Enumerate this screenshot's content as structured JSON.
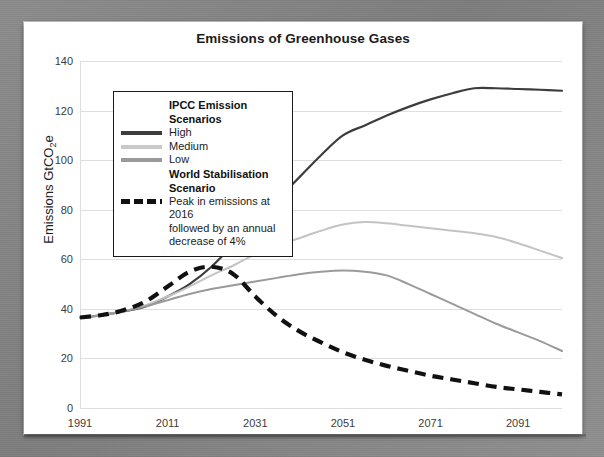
{
  "chart_data": {
    "type": "line",
    "title": "Emissions of Greenhouse Gases",
    "xlabel": "",
    "ylabel": "Emissions GtCO2e",
    "ylabel_prefix": "Emissions GtCO",
    "ylabel_sub": "2",
    "ylabel_suffix": "e",
    "xlim": [
      1991,
      2101
    ],
    "ylim": [
      0,
      140
    ],
    "yticks": [
      0,
      20,
      40,
      60,
      80,
      100,
      120,
      140
    ],
    "xticks": [
      1991,
      2011,
      2031,
      2051,
      2071,
      2091
    ],
    "grid": true,
    "legend_position": "upper-left",
    "series": [
      {
        "name": "High",
        "color": "#3d3d3d",
        "style": "solid",
        "width": 2.2,
        "x": [
          1991,
          1996,
          2001,
          2006,
          2011,
          2016,
          2021,
          2026,
          2031,
          2036,
          2041,
          2046,
          2051,
          2056,
          2061,
          2066,
          2071,
          2076,
          2081,
          2086,
          2091,
          2096,
          2101
        ],
        "y": [
          36.5,
          37.5,
          39,
          41,
          45,
          50,
          57,
          66,
          75,
          84,
          93,
          102,
          110,
          114,
          118,
          121.5,
          124.5,
          127,
          129,
          129,
          128.7,
          128.4,
          128
        ]
      },
      {
        "name": "Medium",
        "color": "#c3c3c3",
        "style": "solid",
        "width": 2.0,
        "x": [
          1991,
          1996,
          2001,
          2006,
          2011,
          2016,
          2021,
          2026,
          2031,
          2036,
          2041,
          2046,
          2051,
          2056,
          2061,
          2066,
          2071,
          2076,
          2081,
          2086,
          2091,
          2096,
          2101
        ],
        "y": [
          36.5,
          37.5,
          39,
          41.5,
          45,
          49,
          53.5,
          57.5,
          62,
          65.5,
          68.5,
          71.5,
          74,
          75,
          74.5,
          73.5,
          72.5,
          71.5,
          70.5,
          69,
          66.5,
          63.5,
          60.5
        ]
      },
      {
        "name": "Low",
        "color": "#9a9a9a",
        "style": "solid",
        "width": 2.0,
        "x": [
          1991,
          1996,
          2001,
          2006,
          2011,
          2016,
          2021,
          2026,
          2031,
          2036,
          2041,
          2046,
          2051,
          2056,
          2061,
          2066,
          2071,
          2076,
          2081,
          2086,
          2091,
          2096,
          2101
        ],
        "y": [
          36.5,
          37.5,
          39,
          41,
          43.5,
          46,
          48,
          49.5,
          51,
          52.5,
          54,
          55,
          55.5,
          55,
          53.5,
          50,
          46,
          42,
          38,
          34,
          30.5,
          27,
          23
        ]
      },
      {
        "name": "Peak in emissions at 2016 followed by an annual decrease of 4%",
        "color": "#111111",
        "style": "dashed",
        "width": 4.2,
        "x": [
          1991,
          1996,
          2001,
          2006,
          2011,
          2016,
          2021,
          2026,
          2031,
          2036,
          2041,
          2046,
          2051,
          2056,
          2061,
          2066,
          2071,
          2076,
          2081,
          2086,
          2091,
          2096,
          2101
        ],
        "y": [
          36.5,
          37.5,
          39.5,
          43,
          49,
          55,
          57,
          54,
          45,
          37,
          31,
          26.5,
          22.5,
          19.5,
          17,
          15,
          13,
          11.5,
          10,
          8.5,
          7.5,
          6.5,
          5.5
        ]
      }
    ]
  },
  "legend": {
    "group1_heading": "IPCC Emission Scenarios",
    "items1": [
      {
        "label": "High",
        "color": "#3d3d3d",
        "style": "solid"
      },
      {
        "label": "Medium",
        "color": "#c9c9c9",
        "style": "solid"
      },
      {
        "label": "Low",
        "color": "#9a9a9a",
        "style": "solid"
      }
    ],
    "group2_heading": "World Stabilisation Scenario",
    "items2": [
      {
        "label": "Peak in emissions at 2016",
        "color": "#111111",
        "style": "dashed"
      }
    ],
    "continuation_lines": [
      "followed by an annual",
      "decrease of 4%"
    ]
  }
}
